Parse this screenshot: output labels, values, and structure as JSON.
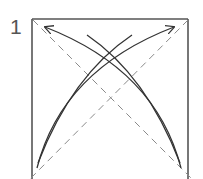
{
  "diagram": {
    "type": "origami-step",
    "step_number": "1",
    "colors": {
      "paper_edge": "#555555",
      "fold_line": "#8a8a8a",
      "arrow": "#333333",
      "background": "#ffffff"
    },
    "elements": [
      {
        "name": "square-paper",
        "kind": "square"
      },
      {
        "name": "diagonal-fold-line-1",
        "kind": "dashed-line",
        "from": "top-left",
        "to": "bottom-right"
      },
      {
        "name": "diagonal-fold-line-2",
        "kind": "dashed-line",
        "from": "bottom-left",
        "to": "top-right"
      },
      {
        "name": "fold-arrow-bl-to-tr",
        "kind": "curved-arrow",
        "from": "bottom-left",
        "to": "top-right"
      },
      {
        "name": "fold-arrow-br-to-tl",
        "kind": "curved-arrow",
        "from": "bottom-right",
        "to": "top-left"
      },
      {
        "name": "unfold-arc-bl",
        "kind": "arc",
        "from": "bottom-left"
      },
      {
        "name": "unfold-arc-br",
        "kind": "arc",
        "from": "bottom-right"
      }
    ]
  }
}
